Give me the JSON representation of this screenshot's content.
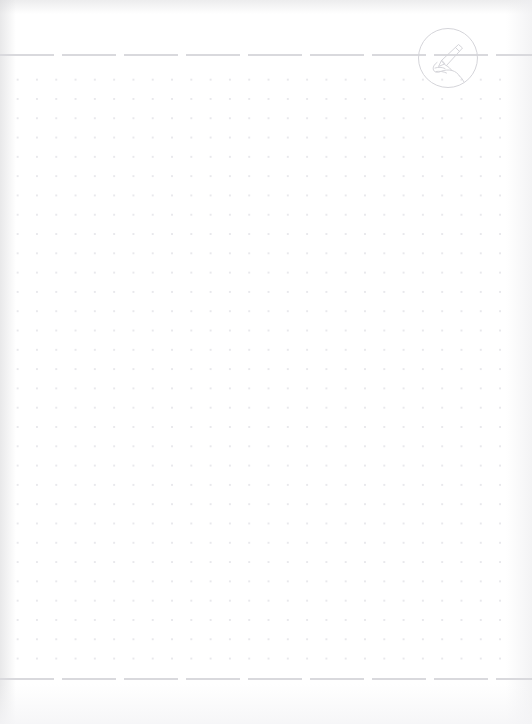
{
  "document": {
    "type": "blank-dot-grid-notebook-page",
    "title": "",
    "body_text": "",
    "page_background": "#ffffff"
  },
  "header": {
    "rule": {
      "name": "header-dashed-rule",
      "style": "dashed",
      "color": "#d9d9dd",
      "dash_length_px": 54,
      "gap_length_px": 8,
      "y_px": 54
    },
    "logo": {
      "name": "writing-hand-logo",
      "icon": "writing-hand-with-pen-icon",
      "shape": "circle",
      "label": "",
      "stroke_color": "#d5d5da",
      "diameter_px": 62,
      "center_x_px": 448,
      "center_y_px": 58
    }
  },
  "main": {
    "grid": {
      "name": "dot-grid",
      "pattern": "dots",
      "dot_color": "#e6e6ea",
      "dot_spacing_px": 19.3,
      "dot_radius_px": 1,
      "top_px": 64,
      "bottom_px": 668,
      "left_px": 2,
      "right_px": 518
    },
    "content": []
  },
  "footer": {
    "rule": {
      "name": "footer-dashed-rule",
      "style": "dashed",
      "color": "#d9d9dd",
      "dash_length_px": 54,
      "gap_length_px": 8,
      "y_px": 678
    },
    "page_number": "",
    "note": ""
  },
  "colors": {
    "paper": "#ffffff",
    "rule": "#d9d9dd",
    "dot": "#e6e6ea",
    "logo_stroke": "#d5d5da",
    "scan_shadow": "#d6d6d8"
  }
}
